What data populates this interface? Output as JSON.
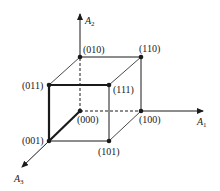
{
  "diagram": {
    "type": "3d-cube-hypercube-encoding",
    "axes": [
      {
        "name": "A1",
        "label": "A",
        "subscript": "1",
        "direction": "right"
      },
      {
        "name": "A2",
        "label": "A",
        "subscript": "2",
        "direction": "up"
      },
      {
        "name": "A3",
        "label": "A",
        "subscript": "3",
        "direction": "down-left"
      }
    ],
    "vertices": [
      {
        "id": "000",
        "label": "(000)"
      },
      {
        "id": "001",
        "label": "(001)"
      },
      {
        "id": "010",
        "label": "(010)"
      },
      {
        "id": "011",
        "label": "(011)"
      },
      {
        "id": "100",
        "label": "(100)"
      },
      {
        "id": "101",
        "label": "(101)"
      },
      {
        "id": "110",
        "label": "(110)"
      },
      {
        "id": "111",
        "label": "(111)"
      }
    ],
    "edges": {
      "solid": [
        "110-010",
        "110-111",
        "110-100",
        "010-011",
        "011-111",
        "111-101",
        "100-101",
        "001-101"
      ],
      "bold": [
        "011-111",
        "011-001",
        "000-001"
      ],
      "dashed": [
        "000-010",
        "000-100"
      ]
    },
    "colors": {
      "line": "#1a1a1a",
      "background": "#ffffff"
    }
  }
}
